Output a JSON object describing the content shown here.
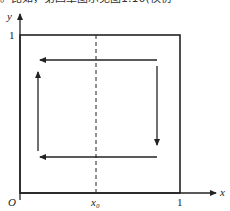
{
  "caption_fragment": "。比如，第四章图示见图1.10(模仿",
  "diagram": {
    "type": "phase-cycle-diagram",
    "axes": {
      "x_label": "x",
      "y_label": "y",
      "origin_label": "O",
      "x_tick_labels": [
        "x₀",
        "1"
      ],
      "y_tick_labels": [
        "1"
      ]
    },
    "square": {
      "x_min": 0,
      "x_max": 1,
      "y_min": 0,
      "y_max": 1
    },
    "dashed_line": {
      "label": "x₀",
      "orientation": "vertical"
    },
    "arrows": [
      {
        "name": "top",
        "direction": "left"
      },
      {
        "name": "right",
        "direction": "down"
      },
      {
        "name": "bottom",
        "direction": "left"
      },
      {
        "name": "left",
        "direction": "up"
      }
    ],
    "colors": {
      "stroke": "#222222",
      "background": "#ffffff"
    }
  }
}
